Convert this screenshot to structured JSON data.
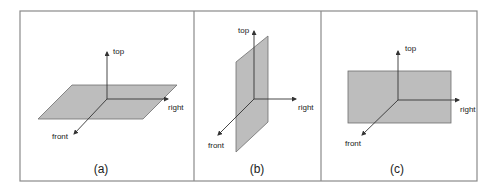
{
  "figure": {
    "panels": [
      {
        "id": "a",
        "caption": "(a)",
        "plane_orientation": "horizontal",
        "axes": {
          "top": "top",
          "right": "right",
          "front": "front"
        }
      },
      {
        "id": "b",
        "caption": "(b)",
        "plane_orientation": "vertical-side",
        "axes": {
          "top": "top",
          "right": "right",
          "front": "front"
        }
      },
      {
        "id": "c",
        "caption": "(c)",
        "plane_orientation": "vertical-front",
        "axes": {
          "top": "top",
          "right": "right",
          "front": "front"
        }
      }
    ],
    "colors": {
      "plane_fill": "#bdbdbd",
      "plane_stroke": "#6e6e6e",
      "axis": "#333333",
      "frame": "#8a8a8a"
    }
  }
}
